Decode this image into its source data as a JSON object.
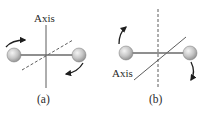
{
  "panels": [
    {
      "id": "a",
      "caption": "(a)",
      "axis_label": "Axis",
      "axis_style": "solid vertical line through rod center",
      "secondary_line_style": "dashed diagonal",
      "rotation_arrows": [
        "top-left clockwise",
        "bottom-right clockwise"
      ]
    },
    {
      "id": "b",
      "caption": "(b)",
      "axis_label": "Axis",
      "axis_style": "solid diagonal line through rod center",
      "secondary_line_style": "dashed vertical",
      "rotation_arrows": [
        "left upward",
        "right downward"
      ]
    }
  ],
  "colors": {
    "line": "#4a4a4a",
    "ball_fill": "#c8c8c8",
    "ball_highlight": "#f2f2f2",
    "ball_stroke": "#6a6a6a",
    "text": "#2a2a2a"
  }
}
